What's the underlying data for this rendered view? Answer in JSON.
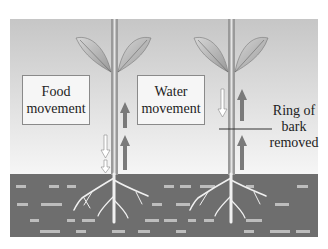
{
  "diagram": {
    "colors": {
      "background_top": "#c9c9c9",
      "background_bottom": "#f4f4f4",
      "soil": "#6e6e6e",
      "soil_dashes": "#bdbdbd",
      "stem": "#9a9a9a",
      "stem_core": "#e8e8e8",
      "leaf": "#b8b8b8",
      "arrow_filled": "#7a7a7a",
      "arrow_outline": "#ffffff",
      "label_box": "#f6f6f6",
      "roots": "#f0f0f0"
    },
    "labels": {
      "food_line1": "Food",
      "food_line2": "movement",
      "water_line1": "Water",
      "water_line2": "movement",
      "ring_line1": "Ring of",
      "ring_line2": "bark",
      "ring_line3": "removed"
    },
    "plants": [
      {
        "name": "intact-plant",
        "stem_x": 114,
        "food_arrows": "down (hollow)",
        "water_arrows": "up (filled)"
      },
      {
        "name": "girdled-plant",
        "stem_x": 231,
        "food_arrows": "down (hollow), stops above ring",
        "water_arrows": "up (filled), continues through ring"
      }
    ]
  }
}
